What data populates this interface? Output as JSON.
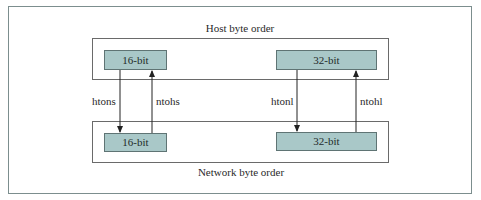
{
  "diagram": {
    "top_group": {
      "label": "Host byte order",
      "cells": [
        {
          "label": "16-bit"
        },
        {
          "label": "32-bit"
        }
      ]
    },
    "bottom_group": {
      "label": "Network byte order",
      "cells": [
        {
          "label": "16-bit"
        },
        {
          "label": "32-bit"
        }
      ]
    },
    "conversions": [
      {
        "label": "htons",
        "direction": "host-to-network",
        "size": "16-bit"
      },
      {
        "label": "ntohs",
        "direction": "network-to-host",
        "size": "16-bit"
      },
      {
        "label": "htonl",
        "direction": "host-to-network",
        "size": "32-bit"
      },
      {
        "label": "ntohl",
        "direction": "network-to-host",
        "size": "32-bit"
      }
    ],
    "colors": {
      "cell_fill": "#a9c8c8",
      "frame_border": "#7c8e8e",
      "arrow": "#222222"
    }
  }
}
